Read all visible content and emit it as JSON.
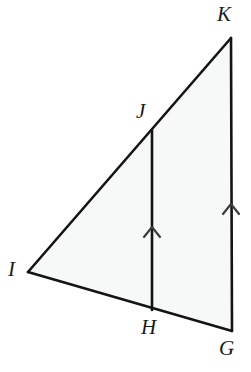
{
  "figure": {
    "canvas": {
      "width": 251,
      "height": 372
    },
    "style": {
      "background_color": "#ffffff",
      "fill_color": "#f7f8f8",
      "stroke_color": "#141414",
      "label_color": "#1a1a1a",
      "stroke_width": 2.6,
      "tick_stroke_width": 2.2
    },
    "points": [
      {
        "name": "K",
        "label": "K",
        "x": 231,
        "y": 38,
        "label_x": 217,
        "label_y": 4
      },
      {
        "name": "J",
        "label": "J",
        "x": 152,
        "y": 130,
        "label_x": 136,
        "label_y": 101
      },
      {
        "name": "I",
        "label": "I",
        "x": 28,
        "y": 272,
        "label_x": 8,
        "label_y": 259
      },
      {
        "name": "H",
        "label": "H",
        "x": 152,
        "y": 310,
        "label_x": 141,
        "label_y": 317
      },
      {
        "name": "G",
        "label": "G",
        "x": 232,
        "y": 331,
        "label_x": 219,
        "label_y": 338
      }
    ],
    "polygon": "28,272 231,38 232,331",
    "segments": [
      {
        "name": "segment-IK",
        "from": "I",
        "to": "K",
        "x1": 28,
        "y1": 272,
        "x2": 231,
        "y2": 38
      },
      {
        "name": "segment-KG",
        "from": "K",
        "to": "G",
        "x1": 231,
        "y1": 38,
        "x2": 232,
        "y2": 331
      },
      {
        "name": "segment-IG",
        "from": "I",
        "to": "G",
        "x1": 28,
        "y1": 272,
        "x2": 232,
        "y2": 331
      },
      {
        "name": "segment-JH",
        "from": "J",
        "to": "H",
        "x1": 152,
        "y1": 130,
        "x2": 152,
        "y2": 310
      }
    ],
    "parallel_marks": [
      {
        "name": "parallel-mark-JH",
        "on_segment": "segment-JH",
        "x": 152,
        "y": 228,
        "points": "144,237 152,227 160,237",
        "direction": "up"
      },
      {
        "name": "parallel-mark-KG",
        "on_segment": "segment-KG",
        "x": 231,
        "y": 205,
        "points": "223,214 231,204 239,214",
        "direction": "up"
      }
    ]
  }
}
